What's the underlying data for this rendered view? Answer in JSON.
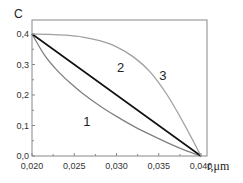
{
  "chart_data": {
    "type": "line",
    "title": "",
    "xlabel": "r,μm",
    "ylabel": "C",
    "xlim": [
      0.02,
      0.0415
    ],
    "ylim": [
      0.0,
      0.43
    ],
    "x_ticks": [
      0.02,
      0.025,
      0.03,
      0.035,
      0.04
    ],
    "x_tick_labels": [
      "0,020",
      "0,025",
      "0,030",
      "0,035",
      "0,040"
    ],
    "y_ticks": [
      0.0,
      0.1,
      0.2,
      0.3,
      0.4
    ],
    "y_tick_labels": [
      "0,0",
      "0,1",
      "0,2",
      "0,3",
      "0,4"
    ],
    "grid": false,
    "legend": "none",
    "series": [
      {
        "name": "1",
        "color": "#808080",
        "x": [
          0.02,
          0.0215,
          0.023,
          0.0245,
          0.026,
          0.028,
          0.03,
          0.032,
          0.034,
          0.036,
          0.038,
          0.04
        ],
        "y": [
          0.4,
          0.33,
          0.28,
          0.24,
          0.205,
          0.165,
          0.13,
          0.098,
          0.07,
          0.044,
          0.02,
          0.0
        ]
      },
      {
        "name": "2",
        "color": "#111111",
        "x": [
          0.02,
          0.04
        ],
        "y": [
          0.4,
          0.0
        ]
      },
      {
        "name": "3",
        "color": "#a0a0a0",
        "x": [
          0.02,
          0.022,
          0.024,
          0.026,
          0.028,
          0.03,
          0.032,
          0.034,
          0.036,
          0.038,
          0.04
        ],
        "y": [
          0.4,
          0.399,
          0.396,
          0.39,
          0.378,
          0.358,
          0.325,
          0.275,
          0.2,
          0.105,
          0.0
        ]
      }
    ],
    "annotations": [
      {
        "text": "1",
        "x": 0.0265,
        "y": 0.1
      },
      {
        "text": "2",
        "x": 0.0305,
        "y": 0.275
      },
      {
        "text": "3",
        "x": 0.0355,
        "y": 0.25
      }
    ]
  }
}
